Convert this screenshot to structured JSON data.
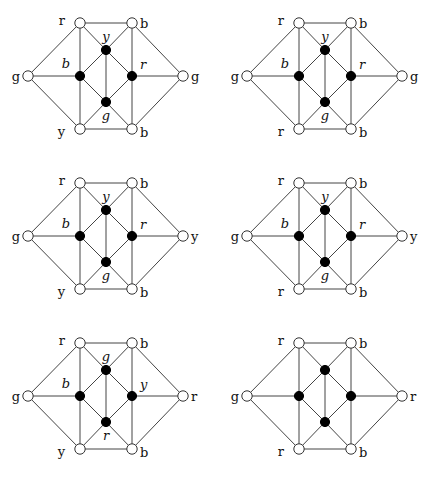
{
  "figure": {
    "node_template": {
      "outer": {
        "tl": [
          80,
          23
        ],
        "tr": [
          132,
          23
        ],
        "l": [
          28,
          76
        ],
        "r": [
          183,
          76
        ],
        "bl": [
          80,
          129
        ],
        "br": [
          132,
          129
        ]
      },
      "inner": {
        "top": [
          106,
          50
        ],
        "left": [
          80,
          76
        ],
        "right": [
          132,
          76
        ],
        "bottom": [
          106,
          102
        ]
      }
    },
    "edges": [
      [
        "tl",
        "tr"
      ],
      [
        "bl",
        "br"
      ],
      [
        "tl",
        "l"
      ],
      [
        "l",
        "bl"
      ],
      [
        "tr",
        "r"
      ],
      [
        "r",
        "br"
      ],
      [
        "tl",
        "left"
      ],
      [
        "left",
        "bl"
      ],
      [
        "tr",
        "right"
      ],
      [
        "right",
        "br"
      ],
      [
        "l",
        "left"
      ],
      [
        "right",
        "r"
      ],
      [
        "tl",
        "top"
      ],
      [
        "top",
        "tr"
      ],
      [
        "bl",
        "bottom"
      ],
      [
        "bottom",
        "br"
      ],
      [
        "top",
        "left"
      ],
      [
        "top",
        "right"
      ],
      [
        "left",
        "bottom"
      ],
      [
        "right",
        "bottom"
      ],
      [
        "top",
        "bottom"
      ]
    ],
    "graphs": [
      {
        "offset": [
          0,
          0
        ],
        "outer_labels": {
          "tl": "r",
          "tr": "b",
          "l": "g",
          "r": "g",
          "bl": "y",
          "br": "b"
        },
        "inner_labels": {
          "top": "y",
          "left": "b",
          "right": "r",
          "bottom": "g"
        }
      },
      {
        "offset": [
          219,
          0
        ],
        "outer_labels": {
          "tl": "r",
          "tr": "b",
          "l": "g",
          "r": "g",
          "bl": "r",
          "br": "b"
        },
        "inner_labels": {
          "top": "y",
          "left": "b",
          "right": "r",
          "bottom": "g"
        }
      },
      {
        "offset": [
          0,
          160
        ],
        "outer_labels": {
          "tl": "r",
          "tr": "b",
          "l": "g",
          "r": "y",
          "bl": "y",
          "br": "b"
        },
        "inner_labels": {
          "top": "y",
          "left": "b",
          "right": "r",
          "bottom": "g"
        }
      },
      {
        "offset": [
          219,
          160
        ],
        "outer_labels": {
          "tl": "r",
          "tr": "b",
          "l": "g",
          "r": "y",
          "bl": "r",
          "br": "b"
        },
        "inner_labels": {
          "top": "y",
          "left": "b",
          "right": "r",
          "bottom": "g"
        }
      },
      {
        "offset": [
          0,
          320
        ],
        "outer_labels": {
          "tl": "r",
          "tr": "b",
          "l": "g",
          "r": "r",
          "bl": "y",
          "br": "b"
        },
        "inner_labels": {
          "top": "g",
          "left": "b",
          "right": "y",
          "bottom": "r"
        }
      },
      {
        "offset": [
          219,
          320
        ],
        "outer_labels": {
          "tl": "r",
          "tr": "b",
          "l": "g",
          "r": "r",
          "bl": "r",
          "br": "b"
        },
        "inner_labels": {}
      }
    ]
  }
}
